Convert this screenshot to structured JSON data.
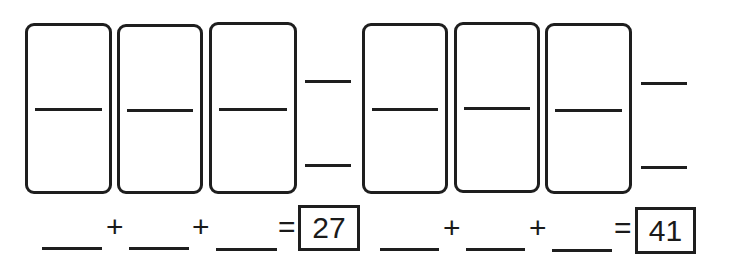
{
  "worksheet": {
    "problems": [
      {
        "dominoes": [
          {
            "top": "",
            "bottom": ""
          },
          {
            "top": "",
            "bottom": ""
          },
          {
            "top": "",
            "bottom": ""
          }
        ],
        "side_answers": {
          "top": "",
          "bottom": ""
        },
        "equation": {
          "addends": [
            "",
            "",
            ""
          ],
          "plus_symbol": "+",
          "equals_symbol": "=",
          "sum": "27"
        }
      },
      {
        "dominoes": [
          {
            "top": "",
            "bottom": ""
          },
          {
            "top": "",
            "bottom": ""
          },
          {
            "top": "",
            "bottom": ""
          }
        ],
        "side_answers": {
          "top": "",
          "bottom": ""
        },
        "equation": {
          "addends": [
            "",
            "",
            ""
          ],
          "plus_symbol": "+",
          "equals_symbol": "=",
          "sum": "41"
        }
      }
    ]
  }
}
